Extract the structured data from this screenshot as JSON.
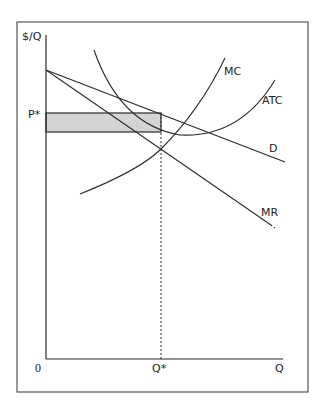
{
  "diagram": {
    "axes": {
      "y_label": "$/Q",
      "x_label": "Q",
      "origin_label": "0"
    },
    "curves": [
      {
        "id": "mc",
        "label": "MC",
        "kind": "marginal-cost"
      },
      {
        "id": "atc",
        "label": "ATC",
        "kind": "average-total-cost"
      },
      {
        "id": "d",
        "label": "D",
        "kind": "demand"
      },
      {
        "id": "mr",
        "label": "MR",
        "kind": "marginal-revenue"
      }
    ],
    "markers": {
      "price_label": "P*",
      "quantity_label": "Q*"
    },
    "profit_region": {
      "description": "economic profit (P* minus ATC at Q*, times Q*)",
      "fill_color": "#d4d4d4"
    },
    "colors": {
      "line": "#2a2a2a",
      "frame": "#555555",
      "fill": "#d4d4d4"
    }
  }
}
